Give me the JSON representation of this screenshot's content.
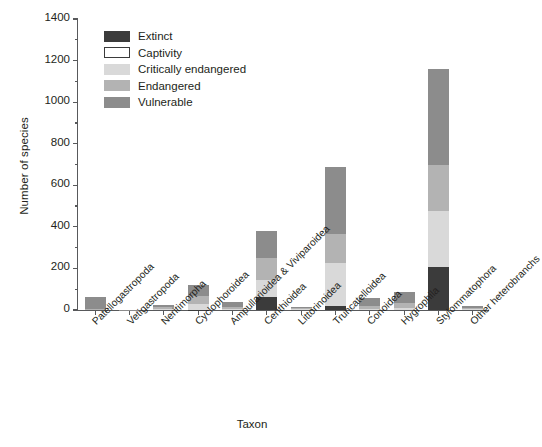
{
  "chart_data": {
    "type": "bar",
    "stacked": true,
    "title": "",
    "xlabel": "Taxon",
    "ylabel": "Number of species",
    "ylim": [
      0,
      1400
    ],
    "yticks": [
      0,
      200,
      400,
      600,
      800,
      1000,
      1200,
      1400
    ],
    "ytick_labels": [
      "0",
      "200",
      "400",
      "600",
      "800",
      "1000",
      "1200",
      "1400"
    ],
    "yminor_step": 100,
    "grid": false,
    "legend_position": "upper left",
    "categories": [
      "Patellogastropoda",
      "Vetigastropoda",
      "Neritimorpha",
      "Cyclophoroidea",
      "Ampullarioidea & Viviparoidea",
      "Cerithioidea",
      "Littorinoidea",
      "Truncatelloidea",
      "Conoidea",
      "Hygrophila",
      "Stylommatophora",
      "Other heterobranchs"
    ],
    "series": [
      {
        "name": "Extinct",
        "color": "#3b3b3b",
        "values": [
          0,
          0,
          0,
          2,
          0,
          65,
          0,
          18,
          0,
          0,
          200,
          0
        ]
      },
      {
        "name": "Captivity",
        "color": "#ffffff",
        "values": [
          0,
          0,
          0,
          0,
          0,
          0,
          0,
          0,
          0,
          0,
          5,
          0
        ]
      },
      {
        "name": "Critically endangered",
        "color": "#d9d9d9",
        "values": [
          0,
          0,
          5,
          26,
          6,
          80,
          4,
          210,
          6,
          12,
          270,
          4
        ]
      },
      {
        "name": "Endangered",
        "color": "#b3b3b3",
        "values": [
          6,
          0,
          8,
          38,
          10,
          105,
          5,
          140,
          14,
          22,
          225,
          6
        ]
      },
      {
        "name": "Vulnerable",
        "color": "#8c8c8c",
        "values": [
          59,
          2,
          12,
          54,
          24,
          130,
          7,
          322,
          40,
          51,
          460,
          10
        ]
      }
    ],
    "totals": [
      65,
      2,
      25,
      120,
      40,
      380,
      16,
      690,
      60,
      85,
      1160,
      20
    ]
  },
  "legend": {
    "entries": [
      {
        "label": "Extinct",
        "color": "#3b3b3b",
        "border": "#3b3b3b"
      },
      {
        "label": "Captivity",
        "color": "#ffffff",
        "border": "#3b3b3b"
      },
      {
        "label": "Critically endangered",
        "color": "#d9d9d9",
        "border": "#d9d9d9"
      },
      {
        "label": "Endangered",
        "color": "#b3b3b3",
        "border": "#b3b3b3"
      },
      {
        "label": "Vulnerable",
        "color": "#8c8c8c",
        "border": "#8c8c8c"
      }
    ]
  }
}
